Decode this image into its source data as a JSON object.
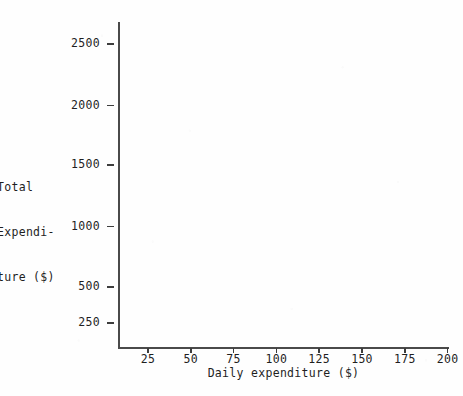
{
  "chart_data": {
    "type": "scatter",
    "title": "",
    "subtitle": "",
    "xlabel": "Daily expenditure ($)",
    "ylabel": "Total Expenditure ($)",
    "ylabel_lines": [
      "Total",
      "Expendi-",
      "ture ($)"
    ],
    "x": [],
    "values": [],
    "series": [],
    "annotations": [],
    "legend": [],
    "legend_position": "none",
    "grid": false,
    "xlim": [
      0,
      212
    ],
    "ylim": [
      0,
      2700
    ],
    "xticks": [
      25,
      50,
      75,
      100,
      125,
      150,
      175,
      200
    ],
    "xtick_labels": [
      "25",
      "50",
      "75",
      "100",
      "125",
      "150",
      "175",
      "200"
    ],
    "yticks": [
      250,
      500,
      1000,
      1500,
      2000,
      2500
    ],
    "ytick_labels": [
      "250",
      "500",
      "1000",
      "1500",
      "2000",
      "2500"
    ],
    "note": "Empty plot axes; no data series are drawn in the plotting region."
  },
  "axes": {
    "y_ticks": [
      {
        "label": "2500",
        "top_px": 44
      },
      {
        "label": "2000",
        "top_px": 105.5
      },
      {
        "label": "1500",
        "top_px": 165
      },
      {
        "label": "1000",
        "top_px": 226.5
      },
      {
        "label": "500",
        "top_px": 287
      },
      {
        "label": "250",
        "top_px": 323
      }
    ],
    "x_ticks": [
      {
        "label": "25",
        "left_px": 148
      },
      {
        "label": "50",
        "left_px": 190.8
      },
      {
        "label": "75",
        "left_px": 233.6
      },
      {
        "label": "100",
        "left_px": 276.4
      },
      {
        "label": "125",
        "left_px": 319.2
      },
      {
        "label": "150",
        "left_px": 362
      },
      {
        "label": "175",
        "left_px": 404.8
      },
      {
        "label": "200",
        "left_px": 447.6
      }
    ]
  },
  "colors": {
    "axis": "#4a4a4a",
    "tick": "#3d3d3d",
    "text": "#1f1f1f",
    "background": "#fefefe"
  }
}
